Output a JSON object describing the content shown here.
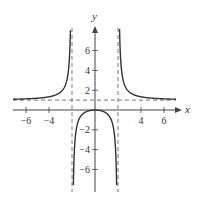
{
  "chart_data": {
    "type": "line",
    "title": "",
    "function": "y = x^2 / (x^2 - 4)",
    "xlabel": "x",
    "ylabel": "y",
    "xlim": [
      -7.1,
      7.4
    ],
    "ylim": [
      -8.3,
      8.3
    ],
    "x_ticks": [
      -6,
      -4,
      4,
      6
    ],
    "x_tick_labels": [
      "−6",
      "−4",
      "4",
      "6"
    ],
    "y_ticks": [
      6,
      4,
      2,
      -2,
      -4,
      -6
    ],
    "y_tick_labels": [
      "6",
      "4",
      "2",
      "−2",
      "−4",
      "−6"
    ],
    "grid": false,
    "asymptotes": {
      "vertical": [
        -2,
        2
      ],
      "horizontal": [
        1
      ]
    },
    "series": [
      {
        "name": "left branch",
        "x": [
          -7,
          -6,
          -5,
          -4,
          -3,
          -2.5,
          -2.2,
          -2.1
        ],
        "y": [
          1.09,
          1.125,
          1.19,
          1.33,
          1.8,
          2.78,
          5.76,
          10.76
        ]
      },
      {
        "name": "middle branch",
        "x": [
          -1.9,
          -1.8,
          -1.5,
          -1,
          0,
          1,
          1.5,
          1.8,
          1.9
        ],
        "y": [
          -9.26,
          -4.26,
          -1.29,
          -0.33,
          0,
          -0.33,
          -1.29,
          -4.26,
          -9.26
        ]
      },
      {
        "name": "right branch",
        "x": [
          2.1,
          2.2,
          2.5,
          3,
          4,
          5,
          6,
          7
        ],
        "y": [
          10.76,
          5.76,
          2.78,
          1.8,
          1.33,
          1.19,
          1.125,
          1.09
        ]
      }
    ],
    "colors": {
      "curve": "#333333",
      "axes": "#444444",
      "asymptote": "#555555"
    }
  }
}
